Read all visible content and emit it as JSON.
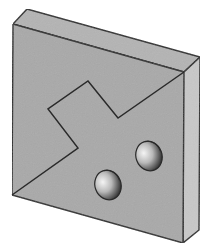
{
  "diagram": {
    "type": "isometric-block",
    "colors": {
      "background": "#ffffff",
      "front_face": "#a9a9a9",
      "top_face": "#b4b4b4",
      "side_face": "#c8c8c8",
      "edge": "#2a2a2a",
      "hole_light": "#f2f2f2",
      "hole_dark": "#1e1e1e"
    },
    "front_face": [
      [
        13,
        24
      ],
      [
        184,
        72
      ],
      [
        183,
        243
      ],
      [
        12,
        195
      ]
    ],
    "top_face": [
      [
        13,
        24
      ],
      [
        27,
        9
      ],
      [
        200,
        57
      ],
      [
        184,
        72
      ]
    ],
    "side_face": [
      [
        184,
        72
      ],
      [
        200,
        57
      ],
      [
        199,
        230
      ],
      [
        183,
        243
      ]
    ],
    "split_line": [
      [
        12,
        195
      ],
      [
        78,
        148
      ],
      [
        48,
        109
      ],
      [
        88,
        81
      ],
      [
        118,
        118
      ],
      [
        184,
        72
      ]
    ],
    "holes": [
      {
        "cx": 149,
        "cy": 156,
        "rx": 13,
        "ry": 15,
        "rotate": -20
      },
      {
        "cx": 108,
        "cy": 185,
        "rx": 13,
        "ry": 15,
        "rotate": -20
      }
    ]
  }
}
